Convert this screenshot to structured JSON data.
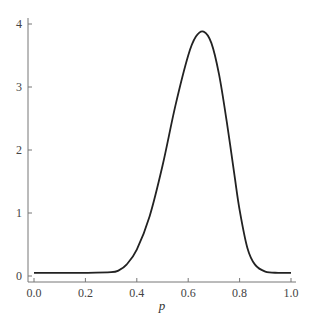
{
  "chart_data": {
    "type": "line",
    "title": "",
    "xlabel": "p",
    "ylabel": "",
    "xlim": [
      0.0,
      1.0
    ],
    "ylim": [
      0,
      4
    ],
    "xticks": [
      "0.0",
      "0.2",
      "0.4",
      "0.6",
      "0.8",
      "1.0"
    ],
    "yticks": [
      "0",
      "1",
      "2",
      "3",
      "4"
    ],
    "grid": false,
    "legend": null,
    "series": [
      {
        "name": "density",
        "color": "#222222",
        "x": [
          0.0,
          0.1,
          0.2,
          0.3,
          0.33,
          0.36,
          0.4,
          0.45,
          0.5,
          0.55,
          0.6,
          0.63,
          0.66,
          0.69,
          0.72,
          0.75,
          0.78,
          0.8,
          0.83,
          0.86,
          0.9,
          0.95,
          1.0
        ],
        "values": [
          0.05,
          0.05,
          0.05,
          0.06,
          0.09,
          0.18,
          0.42,
          0.95,
          1.75,
          2.7,
          3.5,
          3.8,
          3.88,
          3.7,
          3.2,
          2.45,
          1.6,
          1.05,
          0.45,
          0.18,
          0.07,
          0.05,
          0.05
        ]
      }
    ]
  }
}
